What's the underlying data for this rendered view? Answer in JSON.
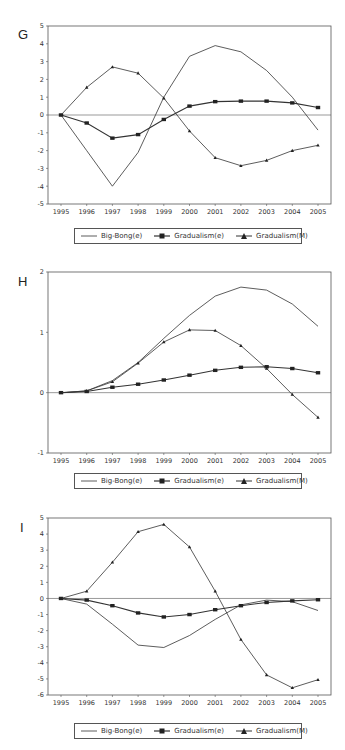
{
  "chart_data": [
    {
      "panel": "G",
      "type": "line",
      "title": "",
      "xlabel": "",
      "ylabel": "",
      "x": [
        1995,
        1996,
        1997,
        1998,
        1999,
        2000,
        2001,
        2002,
        2003,
        2004,
        2005
      ],
      "ylim": [
        -5,
        5
      ],
      "yticks": [
        5,
        4,
        3,
        2,
        1,
        0,
        -1,
        -2,
        -3,
        -4,
        -5
      ],
      "grid": false,
      "zero_line": true,
      "legend_position": "bottom",
      "series": [
        {
          "name": "Big-Bong(e)",
          "marker": "none",
          "values": [
            0,
            -2.0,
            -4.0,
            -2.1,
            1.0,
            3.3,
            3.9,
            3.55,
            2.5,
            1.0,
            -0.85
          ]
        },
        {
          "name": "Gradualism(e)",
          "marker": "square",
          "values": [
            0,
            -0.45,
            -1.3,
            -1.1,
            -0.25,
            0.5,
            0.75,
            0.78,
            0.78,
            0.68,
            0.42
          ]
        },
        {
          "name": "Gradualism(M)",
          "marker": "triangle",
          "values": [
            0,
            1.55,
            2.7,
            2.35,
            0.95,
            -0.9,
            -2.4,
            -2.85,
            -2.55,
            -2.0,
            -1.7
          ]
        }
      ]
    },
    {
      "panel": "H",
      "type": "line",
      "title": "",
      "xlabel": "",
      "ylabel": "",
      "x": [
        1995,
        1996,
        1997,
        1998,
        1999,
        2000,
        2001,
        2002,
        2003,
        2004,
        2005
      ],
      "ylim": [
        -1,
        2
      ],
      "yticks": [
        2,
        1,
        0,
        -1
      ],
      "grid": false,
      "zero_line": true,
      "legend_position": "bottom",
      "series": [
        {
          "name": "Big-Bong(e)",
          "marker": "none",
          "values": [
            0,
            0.03,
            0.2,
            0.5,
            0.9,
            1.28,
            1.6,
            1.75,
            1.7,
            1.47,
            1.1
          ]
        },
        {
          "name": "Gradualism(e)",
          "marker": "square",
          "values": [
            0,
            0.02,
            0.09,
            0.14,
            0.21,
            0.29,
            0.37,
            0.42,
            0.43,
            0.4,
            0.33
          ]
        },
        {
          "name": "Gradualism(M)",
          "marker": "triangle",
          "values": [
            0,
            0.03,
            0.18,
            0.49,
            0.84,
            1.04,
            1.03,
            0.78,
            0.4,
            -0.03,
            -0.41
          ]
        }
      ]
    },
    {
      "panel": "I",
      "type": "line",
      "title": "",
      "xlabel": "",
      "ylabel": "",
      "x": [
        1995,
        1996,
        1997,
        1998,
        1999,
        2000,
        2001,
        2002,
        2003,
        2004,
        2005
      ],
      "ylim": [
        -6,
        5
      ],
      "yticks": [
        5,
        4,
        3,
        2,
        1,
        0,
        -1,
        -2,
        -3,
        -4,
        -5,
        -6
      ],
      "grid": false,
      "zero_line": true,
      "legend_position": "bottom",
      "series": [
        {
          "name": "Big-Bong(e)",
          "marker": "none",
          "values": [
            0,
            -0.35,
            -1.6,
            -2.9,
            -3.05,
            -2.3,
            -1.3,
            -0.4,
            -0.1,
            -0.2,
            -0.75
          ]
        },
        {
          "name": "Gradualism(e)",
          "marker": "square",
          "values": [
            0,
            -0.1,
            -0.45,
            -0.9,
            -1.15,
            -1.0,
            -0.7,
            -0.45,
            -0.25,
            -0.15,
            -0.08
          ]
        },
        {
          "name": "Gradualism(M)",
          "marker": "triangle",
          "values": [
            0,
            0.45,
            2.25,
            4.15,
            4.6,
            3.2,
            0.45,
            -2.55,
            -4.75,
            -5.55,
            -5.05
          ]
        }
      ]
    }
  ],
  "panels": [
    {
      "letter": "G",
      "legend": [
        "Big-Bong(e)",
        "Gradualism(e)",
        "Gradualism(M)"
      ]
    },
    {
      "letter": "H",
      "legend": [
        "Big-Bong(e)",
        "Gradualism(e)",
        "Gradualism(M)"
      ]
    },
    {
      "letter": "I",
      "legend": [
        "Big-Bong(e)",
        "Gradualism(e)",
        "Gradualism(M)"
      ]
    }
  ],
  "colors": {
    "line": "#333333",
    "axis": "#555555",
    "background": "#ffffff"
  }
}
